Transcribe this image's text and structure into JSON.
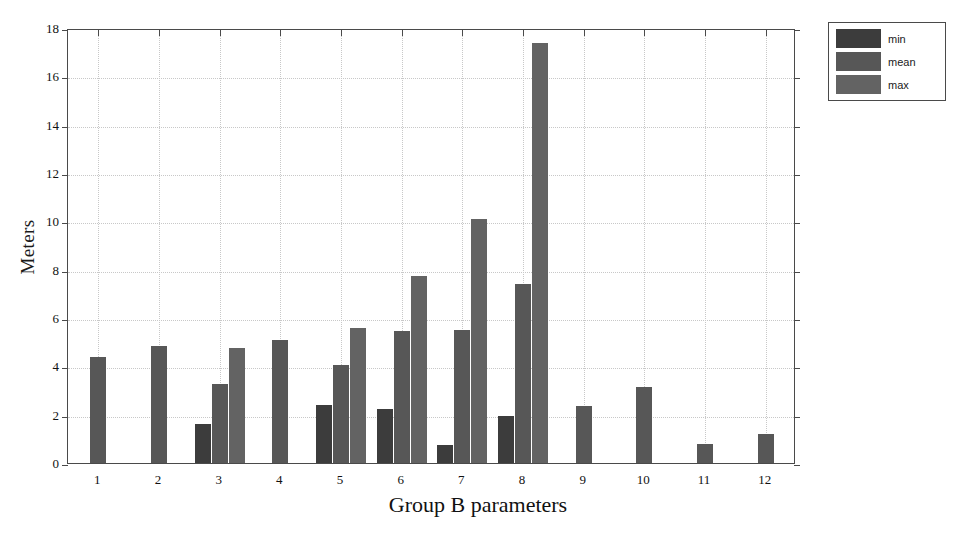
{
  "chart_data": {
    "type": "bar",
    "title": "",
    "xlabel": "Group B parameters",
    "ylabel": "Meters",
    "categories": [
      "1",
      "2",
      "3",
      "4",
      "5",
      "6",
      "7",
      "8",
      "9",
      "10",
      "11",
      "12"
    ],
    "ylim": [
      0,
      18
    ],
    "yticks": [
      0,
      2,
      4,
      6,
      8,
      10,
      12,
      14,
      16,
      18
    ],
    "ytick_labels": [
      "0",
      "2",
      "4",
      "6",
      "8",
      "10",
      "12",
      "14",
      "16",
      "18"
    ],
    "grid": true,
    "legend_position": "outside-top-right",
    "series": [
      {
        "name": "min",
        "color": "#3c3c3c",
        "values": [
          null,
          null,
          1.6,
          null,
          2.4,
          2.25,
          0.75,
          1.95,
          null,
          null,
          null,
          null
        ]
      },
      {
        "name": "mean",
        "color": "#575757",
        "values": [
          4.4,
          4.85,
          3.25,
          5.1,
          4.05,
          5.45,
          5.5,
          7.4,
          2.35,
          3.15,
          0.8,
          1.2
        ]
      },
      {
        "name": "max",
        "color": "#636363",
        "values": [
          null,
          null,
          4.75,
          null,
          5.6,
          7.75,
          10.1,
          17.4,
          null,
          null,
          null,
          null
        ]
      }
    ]
  },
  "legend": {
    "items": [
      {
        "label": "min",
        "color": "#3c3c3c"
      },
      {
        "label": "mean",
        "color": "#575757"
      },
      {
        "label": "max",
        "color": "#636363"
      }
    ]
  },
  "axes": {
    "y_axis_title": "Meters",
    "x_axis_title": "Group B parameters"
  }
}
